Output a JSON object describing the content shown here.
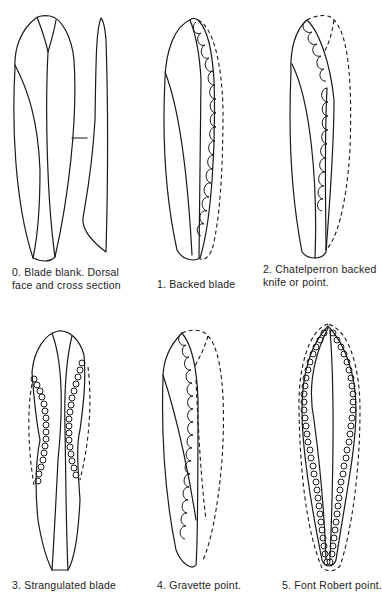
{
  "figure": {
    "panels": [
      {
        "id": 0,
        "caption_line1": "0.  Blade blank. Dorsal",
        "caption_line2": "face and cross section"
      },
      {
        "id": 1,
        "caption_line1": "1.  Backed blade",
        "caption_line2": ""
      },
      {
        "id": 2,
        "caption_line1": "2.  Chatelperron  backed",
        "caption_line2": "knife or point."
      },
      {
        "id": 3,
        "caption_line1": "3.  Strangulated blade",
        "caption_line2": ""
      },
      {
        "id": 4,
        "caption_line1": "4.  Gravette point.",
        "caption_line2": ""
      },
      {
        "id": 5,
        "caption_line1": "5.  Font Robert point.",
        "caption_line2": ""
      }
    ],
    "ink_color": "#1a1a1a",
    "background": "#ffffff"
  }
}
